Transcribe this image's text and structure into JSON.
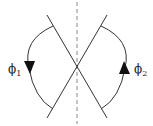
{
  "diagram": {
    "labels": {
      "phi1": "ϕ",
      "phi1_sub": "1",
      "phi2": "ϕ",
      "phi2_sub": "2"
    },
    "colors": {
      "stroke": "#333333",
      "dashed": "#888888",
      "arrow": "#111111"
    }
  }
}
